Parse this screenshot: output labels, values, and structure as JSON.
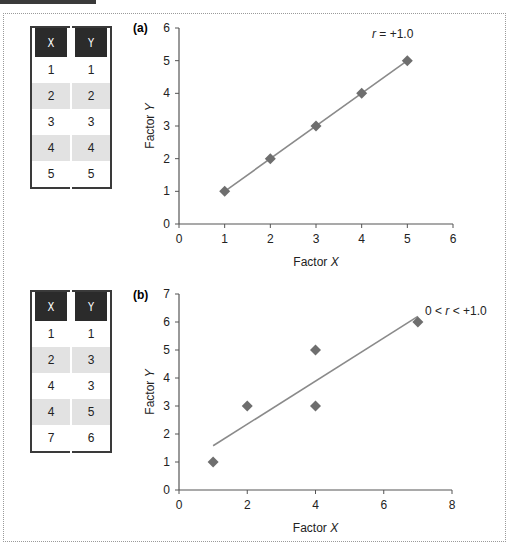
{
  "chart_data": [
    {
      "type": "scatter",
      "panel_label": "(a)",
      "xlabel": "Factor X",
      "ylabel": "Factor Y",
      "xlim": [
        0,
        6
      ],
      "ylim": [
        0,
        6
      ],
      "x_ticks": [
        "0",
        "1",
        "2",
        "3",
        "4",
        "5",
        "6"
      ],
      "y_ticks": [
        "0",
        "1",
        "2",
        "3",
        "4",
        "5",
        "6"
      ],
      "grid": false,
      "annotation": "r = +1.0",
      "series": [
        {
          "name": "data",
          "x": [
            1,
            2,
            3,
            4,
            5
          ],
          "y": [
            1,
            2,
            3,
            4,
            5
          ]
        }
      ],
      "trend_line": {
        "x": [
          1,
          5
        ],
        "y": [
          1,
          5
        ]
      },
      "table": {
        "headers": [
          "X",
          "Y"
        ],
        "rows": [
          [
            "1",
            "1"
          ],
          [
            "2",
            "2"
          ],
          [
            "3",
            "3"
          ],
          [
            "4",
            "4"
          ],
          [
            "5",
            "5"
          ]
        ]
      }
    },
    {
      "type": "scatter",
      "panel_label": "(b)",
      "xlabel": "Factor X",
      "ylabel": "Factor Y",
      "xlim": [
        0,
        8
      ],
      "ylim": [
        0,
        7
      ],
      "x_ticks": [
        "0",
        "2",
        "4",
        "6",
        "8"
      ],
      "y_ticks": [
        "0",
        "1",
        "2",
        "3",
        "4",
        "5",
        "6",
        "7"
      ],
      "grid": false,
      "annotation": "0 < r < +1.0",
      "series": [
        {
          "name": "data",
          "x": [
            1,
            2,
            4,
            4,
            7
          ],
          "y": [
            1,
            3,
            3,
            5,
            6
          ]
        }
      ],
      "trend_line": {
        "x": [
          1,
          7
        ],
        "y": [
          1.58,
          6.2
        ]
      },
      "table": {
        "headers": [
          "X",
          "Y"
        ],
        "rows": [
          [
            "1",
            "1"
          ],
          [
            "2",
            "3"
          ],
          [
            "4",
            "3"
          ],
          [
            "4",
            "5"
          ],
          [
            "7",
            "6"
          ]
        ]
      }
    }
  ]
}
